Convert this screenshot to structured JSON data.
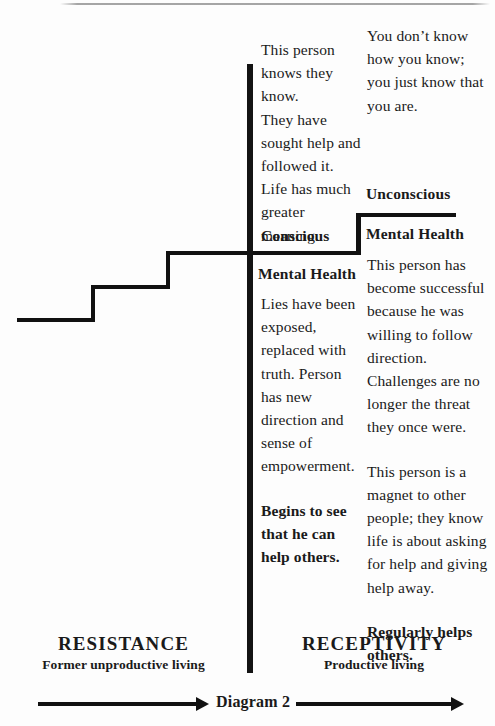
{
  "figure": {
    "caption": "Diagram 2",
    "stroke_color": "#111111",
    "background_color": "#fdfdfd"
  },
  "labels": {
    "conscious": "Conscious",
    "unconscious": "Unconscious",
    "mental_health_left": "Mental Health",
    "mental_health_right": "Mental Health"
  },
  "columns": {
    "middle": {
      "paragraphs": [
        {
          "text": "This person knows they know.\nThey have sought help and followed it. Life has much greater meaning.",
          "weight": "normal"
        },
        {
          "text": "Lies have been exposed, replaced with truth. Person has new direction and sense of empowerment.",
          "weight": "normal"
        },
        {
          "text": "Begins to see that he can help others.",
          "weight": "bold"
        }
      ]
    },
    "right": {
      "paragraphs": [
        {
          "text": "You don’t know how you know; you just know that you are.",
          "weight": "normal"
        },
        {
          "text": "This person has become successful because he was willing to follow direction. Challenges are no longer the threat they once were.",
          "weight": "normal"
        },
        {
          "text": "This person is a magnet to other people; they know life is about asking for help and giving help away.",
          "weight": "normal"
        },
        {
          "text": "Regularly helps others.",
          "weight": "bold"
        }
      ]
    }
  },
  "footer": {
    "left_heading": "RESISTANCE",
    "left_subheading": "Former unproductive living",
    "right_heading": "RECEPTIVITY",
    "right_subheading": "Productive living",
    "caption": "Diagram 2"
  }
}
